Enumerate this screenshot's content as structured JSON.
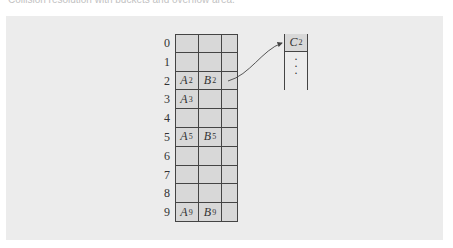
{
  "caption": "Collision resolution with buckets and overflow area.",
  "table": {
    "row_labels": [
      "0",
      "1",
      "2",
      "3",
      "4",
      "5",
      "6",
      "7",
      "8",
      "9"
    ],
    "columns": 3,
    "cells": [
      {
        "row": 2,
        "col": 0,
        "base": "A",
        "sub": "2"
      },
      {
        "row": 2,
        "col": 1,
        "base": "B",
        "sub": "2"
      },
      {
        "row": 3,
        "col": 0,
        "base": "A",
        "sub": "3"
      },
      {
        "row": 5,
        "col": 0,
        "base": "A",
        "sub": "5"
      },
      {
        "row": 5,
        "col": 1,
        "base": "B",
        "sub": "5"
      },
      {
        "row": 9,
        "col": 0,
        "base": "A",
        "sub": "9"
      },
      {
        "row": 9,
        "col": 1,
        "base": "B",
        "sub": "9"
      }
    ]
  },
  "overflow": {
    "entry": {
      "base": "C",
      "sub": "2"
    },
    "continuation": "⋮"
  },
  "arrow": {
    "from_row": 2,
    "to": "overflow-entry"
  },
  "colors": {
    "panel_bg": "#ececec",
    "cell_bg": "#d8d8d8",
    "line": "#444444"
  }
}
